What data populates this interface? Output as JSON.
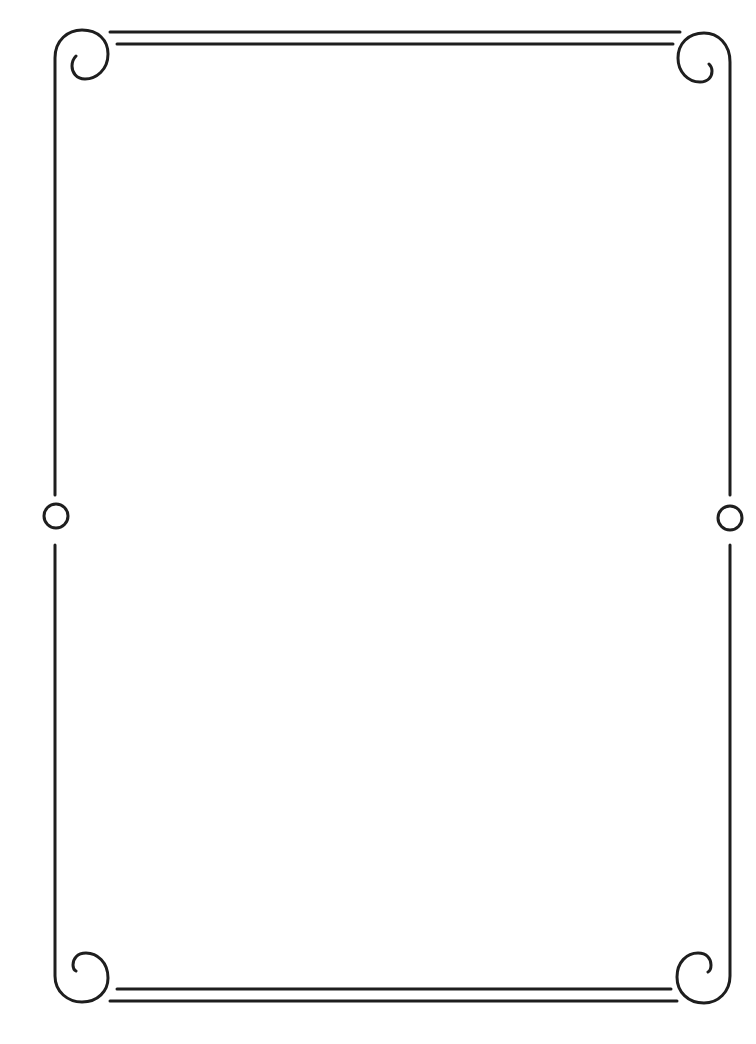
{
  "page": {
    "type": "decorative-page-border",
    "background_color": "#ffffff",
    "line_color": "#1e1e1e"
  },
  "border": {
    "top_rule_count": 2,
    "bottom_rule_count": 2,
    "corner_ornaments": [
      "top-left-scroll",
      "top-right-scroll",
      "bottom-left-scroll",
      "bottom-right-scroll"
    ],
    "side_ornaments": [
      "left-circle",
      "right-circle"
    ]
  }
}
